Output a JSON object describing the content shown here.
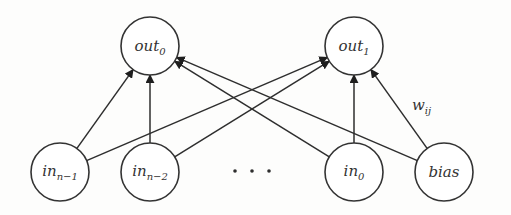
{
  "nodes": {
    "out0": {
      "base": "out",
      "sub": "0"
    },
    "out1": {
      "base": "out",
      "sub": "1"
    },
    "in_n_minus_1": {
      "base": "in",
      "sub": "n−1"
    },
    "in_n_minus_2": {
      "base": "in",
      "sub": "n−2"
    },
    "in0": {
      "base": "in",
      "sub": "0"
    },
    "bias": {
      "base": "bias",
      "sub": ""
    }
  },
  "ellipsis": "· · ·",
  "weight_label": {
    "base": "w",
    "sub": "ij"
  },
  "edges": [
    {
      "from": "in_n_minus_1",
      "to": "out0"
    },
    {
      "from": "in_n_minus_1",
      "to": "out1"
    },
    {
      "from": "in_n_minus_2",
      "to": "out0"
    },
    {
      "from": "in_n_minus_2",
      "to": "out1"
    },
    {
      "from": "in0",
      "to": "out0"
    },
    {
      "from": "in0",
      "to": "out1"
    },
    {
      "from": "bias",
      "to": "out0"
    },
    {
      "from": "bias",
      "to": "out1"
    }
  ]
}
